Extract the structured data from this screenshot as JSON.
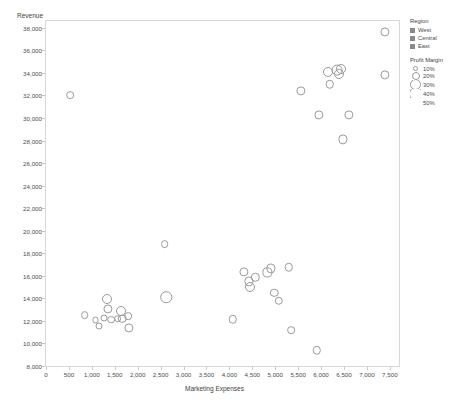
{
  "chart_data": {
    "type": "scatter",
    "title": "",
    "xlabel": "Marketing Expenses",
    "ylabel": "Revenue",
    "xlim": [
      0,
      7700
    ],
    "ylim": [
      8000,
      38600
    ],
    "grid": false,
    "x_ticks": [
      0,
      500,
      1000,
      1500,
      2000,
      2500,
      3000,
      3500,
      4000,
      4500,
      5000,
      5500,
      6000,
      6500,
      7000,
      7500
    ],
    "x_tick_labels": [
      "0",
      "500",
      "1,000",
      "1,500",
      "2,000",
      "2,500",
      "3,000",
      "3,500",
      "4,000",
      "4,500",
      "5,000",
      "5,500",
      "6,000",
      "6,500",
      "7,000",
      "7,500"
    ],
    "y_ticks": [
      8000,
      10000,
      12000,
      14000,
      16000,
      18000,
      20000,
      22000,
      24000,
      26000,
      28000,
      30000,
      32000,
      34000,
      36000,
      38000
    ],
    "y_tick_labels": [
      "8,000",
      "10,000",
      "12,000",
      "14,000",
      "16,000",
      "18,000",
      "20,000",
      "22,000",
      "24,000",
      "26,000",
      "28,000",
      "30,000",
      "32,000",
      "34,000",
      "36,000",
      "38,000"
    ],
    "legend_position": "right",
    "marker_style": "open-circle",
    "size_encoding": "Profit Margin",
    "color_encoding": "Region",
    "points": [
      {
        "x": 520,
        "y": 32000,
        "size": 20
      },
      {
        "x": 840,
        "y": 12500,
        "size": 20
      },
      {
        "x": 1080,
        "y": 12050,
        "size": 18
      },
      {
        "x": 1150,
        "y": 11550,
        "size": 18
      },
      {
        "x": 1270,
        "y": 12250,
        "size": 18
      },
      {
        "x": 1340,
        "y": 13900,
        "size": 26
      },
      {
        "x": 1350,
        "y": 13050,
        "size": 24
      },
      {
        "x": 1420,
        "y": 12100,
        "size": 20
      },
      {
        "x": 1560,
        "y": 12200,
        "size": 20
      },
      {
        "x": 1640,
        "y": 12900,
        "size": 26
      },
      {
        "x": 1660,
        "y": 12200,
        "size": 22
      },
      {
        "x": 1790,
        "y": 12400,
        "size": 20
      },
      {
        "x": 1800,
        "y": 11350,
        "size": 24
      },
      {
        "x": 2590,
        "y": 18800,
        "size": 20
      },
      {
        "x": 2620,
        "y": 14100,
        "size": 30
      },
      {
        "x": 4080,
        "y": 12150,
        "size": 22
      },
      {
        "x": 4320,
        "y": 16350,
        "size": 24
      },
      {
        "x": 4420,
        "y": 15500,
        "size": 24
      },
      {
        "x": 4450,
        "y": 15050,
        "size": 26
      },
      {
        "x": 4560,
        "y": 15850,
        "size": 22
      },
      {
        "x": 4830,
        "y": 16300,
        "size": 24
      },
      {
        "x": 4900,
        "y": 16650,
        "size": 24
      },
      {
        "x": 4980,
        "y": 14500,
        "size": 22
      },
      {
        "x": 5080,
        "y": 13800,
        "size": 22
      },
      {
        "x": 5300,
        "y": 16750,
        "size": 22
      },
      {
        "x": 5350,
        "y": 11150,
        "size": 20
      },
      {
        "x": 5560,
        "y": 32400,
        "size": 24
      },
      {
        "x": 5910,
        "y": 9400,
        "size": 22
      },
      {
        "x": 5960,
        "y": 30300,
        "size": 24
      },
      {
        "x": 6160,
        "y": 34100,
        "size": 26
      },
      {
        "x": 6190,
        "y": 33000,
        "size": 22
      },
      {
        "x": 6350,
        "y": 34250,
        "size": 28
      },
      {
        "x": 6400,
        "y": 33900,
        "size": 26
      },
      {
        "x": 6430,
        "y": 34300,
        "size": 26
      },
      {
        "x": 6480,
        "y": 28100,
        "size": 24
      },
      {
        "x": 6600,
        "y": 30300,
        "size": 24
      },
      {
        "x": 7390,
        "y": 37600,
        "size": 24
      },
      {
        "x": 7400,
        "y": 33800,
        "size": 24
      }
    ]
  },
  "legend": {
    "region": {
      "title": "Region",
      "items": [
        {
          "label": "West",
          "color": "#8a8a8a"
        },
        {
          "label": "Central",
          "color": "#8a8a8a"
        },
        {
          "label": "East",
          "color": "#8a8a8a"
        }
      ]
    },
    "profit_margin": {
      "title": "Profit Margin",
      "items": [
        {
          "label": "10%",
          "size": 5
        },
        {
          "label": "20%",
          "size": 8
        },
        {
          "label": "30%",
          "size": 11
        },
        {
          "label": "40%",
          "size": 14
        },
        {
          "label": "50%",
          "size": 17
        }
      ]
    }
  },
  "colors": {
    "marker_stroke": "#9a9a9a",
    "frame": "#d8d8d8",
    "text": "#4a4a4a"
  }
}
